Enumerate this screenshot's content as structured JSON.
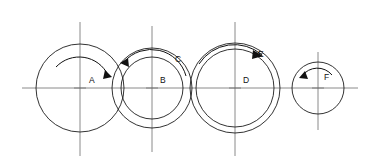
{
  "diagram": {
    "background_color": "#ffffff",
    "line_color": "#1c1c1c",
    "centerline_color": "#6d6d6d",
    "main_axis": {
      "y": 88,
      "x_start": 22,
      "x_end": 358
    },
    "labels": {
      "a": "A",
      "b": "B",
      "c": "C",
      "d": "D",
      "e": "E",
      "f": "F"
    },
    "stations": [
      {
        "id": "station-a",
        "label": "A",
        "cx": 80,
        "cy": 88,
        "radii": [
          44
        ],
        "rotation": "clockwise",
        "label_x": 89,
        "label_y": 83,
        "vline_top": 22,
        "vline_bottom": 156
      },
      {
        "id": "station-b",
        "label": "B",
        "cx": 152,
        "cy": 88,
        "radii": [
          31,
          40
        ],
        "rotation": "counterclockwise",
        "label_x": 160,
        "label_y": 83,
        "vline_top": 26,
        "vline_bottom": 152
      },
      {
        "id": "station-c",
        "label": "C",
        "cx": 152,
        "cy": 88,
        "radii": [
          40
        ],
        "rotation": "counterclockwise",
        "label_x": 175,
        "label_y": 62,
        "vline_top": 26,
        "vline_bottom": 152
      },
      {
        "id": "station-d",
        "label": "D",
        "cx": 235,
        "cy": 88,
        "radii": [
          39,
          45
        ],
        "rotation": "clockwise",
        "label_x": 243,
        "label_y": 83,
        "vline_top": 22,
        "vline_bottom": 156
      },
      {
        "id": "station-e",
        "label": "E",
        "cx": 235,
        "cy": 88,
        "radii": [
          45
        ],
        "rotation": "clockwise",
        "label_x": 258,
        "label_y": 57,
        "vline_top": 22,
        "vline_bottom": 156
      },
      {
        "id": "station-f",
        "label": "F",
        "cx": 318,
        "cy": 88,
        "radii": [
          26
        ],
        "rotation": "counterclockwise",
        "label_x": 324,
        "label_y": 80,
        "vline_top": 52,
        "vline_bottom": 130
      }
    ],
    "rotation_arrows": [
      {
        "id": "arrow-a",
        "for": "A",
        "direction": "clockwise",
        "cx": 80,
        "cy": 88,
        "radius": 32
      },
      {
        "id": "arrow-b",
        "for": "B",
        "direction": "counterclockwise",
        "cx": 152,
        "cy": 88,
        "radius": 36
      },
      {
        "id": "arrow-e",
        "for": "E",
        "direction": "clockwise",
        "cx": 235,
        "cy": 88,
        "radius": 42
      },
      {
        "id": "arrow-f",
        "for": "F",
        "direction": "counterclockwise",
        "cx": 318,
        "cy": 88,
        "radius": 19
      }
    ]
  }
}
